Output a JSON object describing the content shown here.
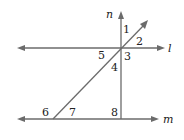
{
  "diagram": {
    "type": "geometry-lines-transversal",
    "lines": [
      {
        "name": "l",
        "label": "l",
        "description": "horizontal line, arrows both ends"
      },
      {
        "name": "m",
        "label": "m",
        "description": "horizontal line, arrows both ends, parallel to l"
      },
      {
        "name": "n",
        "label": "n",
        "description": "vertical ray from m upward, perpendicular to l and m"
      },
      {
        "name": "transversal",
        "label": "",
        "description": "diagonal line from m up-right through intersection of l and n"
      }
    ],
    "angles": [
      {
        "label": "1",
        "position": "between n (up) and transversal (up-right)"
      },
      {
        "label": "2",
        "position": "between transversal (up-right) and l (right)"
      },
      {
        "label": "3",
        "position": "between l (right) and n (down)"
      },
      {
        "label": "4",
        "position": "between n (down) and transversal (down-left)"
      },
      {
        "label": "5",
        "position": "between transversal (down-left) and l (left)"
      },
      {
        "label": "6",
        "position": "left of transversal above m, outside"
      },
      {
        "label": "7",
        "position": "right of transversal above m, inside"
      },
      {
        "label": "8",
        "position": "left of n above m"
      }
    ],
    "colors": {
      "line": "#6b6b6b",
      "text": "#222222",
      "background": "#ffffff"
    }
  }
}
